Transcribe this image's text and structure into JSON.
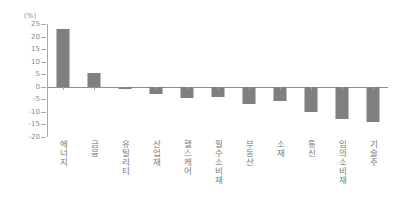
{
  "chart": {
    "unit_label": "(%)",
    "y_ticks": [
      "25",
      "20",
      "15",
      "10",
      "5",
      "0",
      "-5",
      "-10",
      "-15",
      "-20"
    ],
    "bar_color": "#7f7f7f",
    "axis_color": "#a8a8a8",
    "text_color": "#808080"
  },
  "chart_data": {
    "type": "bar",
    "title": "",
    "subtitle": "",
    "xlabel": "",
    "ylabel": "(%)",
    "ylim": [
      -20,
      25
    ],
    "ytick_step": 5,
    "grid": false,
    "legend": false,
    "orientation": "vertical",
    "categories": [
      "에너지",
      "금융",
      "유틸리티",
      "산업재",
      "헬스케어",
      "필수소비재",
      "부동산",
      "소재",
      "통신",
      "임의소비재",
      "기술주"
    ],
    "values": [
      23,
      5.5,
      -0.7,
      -3,
      -4.5,
      -4,
      -7,
      -5.5,
      -10,
      -13,
      -14
    ],
    "series": [
      {
        "name": "",
        "values": [
          23,
          5.5,
          -0.7,
          -3,
          -4.5,
          -4,
          -7,
          -5.5,
          -10,
          -13,
          -14
        ]
      }
    ]
  }
}
